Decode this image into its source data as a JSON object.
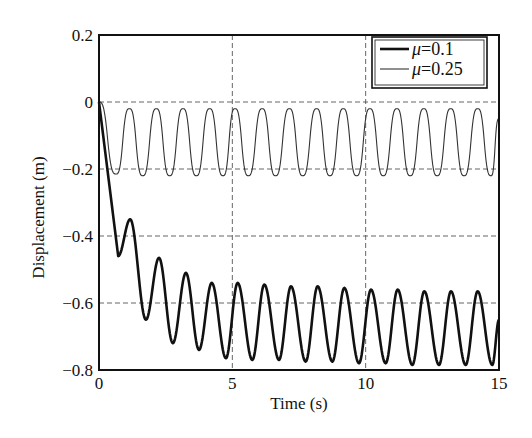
{
  "chart_data": {
    "type": "line",
    "title": "",
    "xlabel": "Time (s)",
    "ylabel": "Displacement (m)",
    "xlim": [
      0,
      15
    ],
    "ylim": [
      -0.8,
      0.2
    ],
    "xticks": [
      0,
      5,
      10,
      15
    ],
    "xtick_labels": [
      "0",
      "5",
      "10",
      "15"
    ],
    "yticks": [
      0.2,
      0,
      -0.2,
      -0.4,
      -0.6,
      -0.8
    ],
    "ytick_labels": [
      "0.2",
      "0",
      "−0.2",
      "−0.4",
      "−0.6",
      "−0.8"
    ],
    "grid": true,
    "grid_style": "dashed",
    "legend_position": "upper right",
    "series": [
      {
        "name": "μ=0.1",
        "legend_symbol": "μ",
        "legend_value": "=0.1",
        "line_width": 2.6,
        "color": "#111111",
        "x": [
          0,
          0.72,
          1.17,
          1.76,
          2.25,
          2.77,
          3.26,
          3.75,
          4.23,
          4.76,
          5.2,
          5.75,
          6.2,
          6.75,
          7.2,
          7.75,
          8.2,
          8.75,
          9.2,
          9.75,
          10.2,
          10.75,
          11.2,
          11.75,
          12.2,
          12.75,
          13.2,
          13.75,
          14.2,
          14.75,
          15.0
        ],
        "y": [
          0,
          -0.46,
          -0.35,
          -0.65,
          -0.465,
          -0.72,
          -0.51,
          -0.74,
          -0.54,
          -0.765,
          -0.54,
          -0.77,
          -0.545,
          -0.77,
          -0.55,
          -0.775,
          -0.55,
          -0.775,
          -0.555,
          -0.78,
          -0.56,
          -0.78,
          -0.56,
          -0.785,
          -0.565,
          -0.785,
          -0.565,
          -0.785,
          -0.565,
          -0.785,
          -0.65
        ]
      },
      {
        "name": "μ=0.25",
        "legend_symbol": "μ",
        "legend_value": "=0.25",
        "line_width": 1.1,
        "color": "#333333",
        "x": [
          0,
          0.64,
          1.14,
          1.64,
          2.15,
          2.65,
          3.15,
          3.65,
          4.15,
          4.65,
          5.1,
          5.6,
          6.12,
          6.62,
          7.14,
          7.64,
          8.16,
          8.66,
          9.16,
          9.66,
          10.16,
          10.66,
          11.17,
          11.67,
          12.18,
          12.68,
          13.19,
          13.69,
          14.2,
          14.7,
          15.0
        ],
        "y": [
          0,
          -0.215,
          -0.02,
          -0.22,
          -0.02,
          -0.22,
          -0.02,
          -0.22,
          -0.02,
          -0.22,
          -0.02,
          -0.22,
          -0.02,
          -0.22,
          -0.02,
          -0.22,
          -0.02,
          -0.22,
          -0.02,
          -0.22,
          -0.02,
          -0.22,
          -0.02,
          -0.22,
          -0.02,
          -0.22,
          -0.02,
          -0.22,
          -0.02,
          -0.22,
          -0.05
        ]
      }
    ]
  },
  "layout": {
    "plot_left": 99,
    "plot_right": 499,
    "plot_top": 35,
    "plot_bottom": 370
  }
}
